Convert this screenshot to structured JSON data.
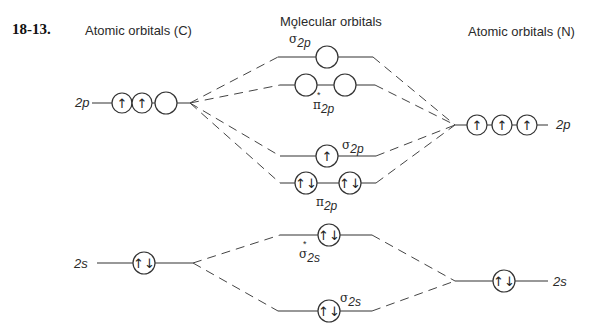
{
  "problem_number": "18-13.",
  "headers": {
    "left": "Atomic orbitals (C)",
    "middle": "Molecular orbitals",
    "right": "Atomic orbitals (N)"
  },
  "atomic_orbitals": {
    "carbon": [
      {
        "label": "2p",
        "electrons": [
          "up",
          "up",
          "empty"
        ]
      },
      {
        "label": "2s",
        "electrons": [
          "pair"
        ]
      }
    ],
    "nitrogen": [
      {
        "label": "2p",
        "electrons": [
          "up",
          "up",
          "up"
        ]
      },
      {
        "label": "2s",
        "electrons": [
          "pair"
        ]
      }
    ]
  },
  "molecular_orbitals": [
    {
      "name": "sigma_star_2p",
      "symbol": "σ",
      "star": "*",
      "subscript": "2p",
      "electrons": [
        "empty"
      ]
    },
    {
      "name": "pi_star_2p",
      "symbol": "π",
      "star": "*",
      "subscript": "2p",
      "electrons": [
        "empty",
        "empty"
      ]
    },
    {
      "name": "sigma_2p",
      "symbol": "σ",
      "star": "",
      "subscript": "2p",
      "electrons": [
        "up"
      ]
    },
    {
      "name": "pi_2p",
      "symbol": "π",
      "star": "",
      "subscript": "2p",
      "electrons": [
        "pair",
        "pair"
      ]
    },
    {
      "name": "sigma_star_2s",
      "symbol": "σ",
      "star": "*",
      "subscript": "2s",
      "electrons": [
        "pair"
      ]
    },
    {
      "name": "sigma_2s",
      "symbol": "σ",
      "star": "",
      "subscript": "2s",
      "electrons": [
        "pair"
      ]
    }
  ],
  "glyphs": {
    "up": "↑",
    "pair": "↑↓",
    "empty": ""
  }
}
